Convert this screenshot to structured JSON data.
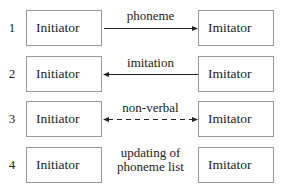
{
  "rows": [
    {
      "number": "1",
      "left": "Initiator",
      "right": "Imitator",
      "label": "phoneme",
      "arrow": "left-to-right",
      "style": "solid"
    },
    {
      "number": "2",
      "left": "Initiator",
      "right": "Imitator",
      "label": "imitation",
      "arrow": "right-to-left",
      "style": "solid"
    },
    {
      "number": "3",
      "left": "Initiator",
      "right": "Imitator",
      "label": "non-verbal",
      "arrow": "bidirectional",
      "style": "dashed"
    },
    {
      "number": "4",
      "left": "Initiator",
      "right": "Imitator",
      "label_line1": "updating of",
      "label_line2": "phoneme list",
      "arrow": "none",
      "style": "none"
    }
  ],
  "colors": {
    "line": "#222222",
    "box_border": "#9a9a9a"
  }
}
